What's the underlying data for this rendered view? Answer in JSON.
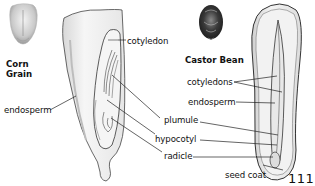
{
  "figure": {
    "page_number": "111",
    "corn": {
      "title_line1": "Corn",
      "title_line2": "Grain",
      "labels": {
        "cotyledon": "cotyledon",
        "endosperm": "endosperm"
      }
    },
    "castor": {
      "title": "Castor Bean",
      "labels": {
        "cotyledons": "cotyledons",
        "endosperm": "endosperm",
        "seed_coat": "seed coat"
      }
    },
    "shared_labels": {
      "plumule": "plumule",
      "hypocotyl": "hypocotyl",
      "radicle": "radicle"
    },
    "colors": {
      "line": "#222222",
      "corn_fill": "#f1f1f1",
      "corn_shade": "#cfcfcf",
      "bean_fill": "#eeeeee",
      "bean_dark": "#3a3a3a"
    }
  }
}
